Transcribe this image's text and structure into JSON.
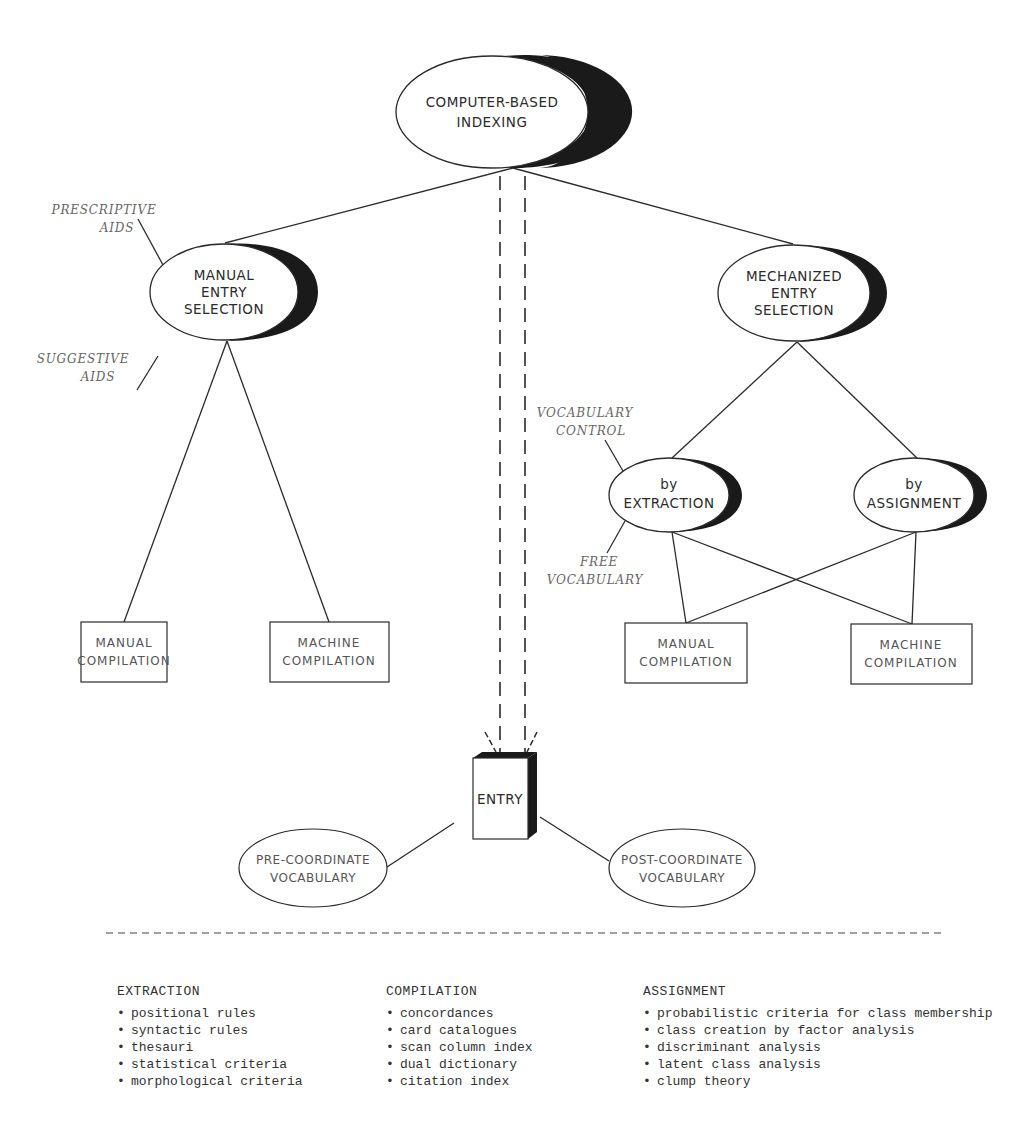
{
  "nodes": {
    "root": {
      "lines": [
        "COMPUTER-BASED",
        "INDEXING"
      ]
    },
    "manual_entry": {
      "lines": [
        "MANUAL",
        "ENTRY",
        "SELECTION"
      ]
    },
    "mechanized_entry": {
      "lines": [
        "MECHANIZED",
        "ENTRY",
        "SELECTION"
      ]
    },
    "by_extraction": {
      "lines": [
        "by",
        "EXTRACTION"
      ]
    },
    "by_assignment": {
      "lines": [
        "by",
        "ASSIGNMENT"
      ]
    },
    "entry": {
      "label": "ENTRY"
    },
    "pre_coordinate": {
      "lines": [
        "PRE-COORDINATE",
        "VOCABULARY"
      ]
    },
    "post_coordinate": {
      "lines": [
        "POST-COORDINATE",
        "VOCABULARY"
      ]
    }
  },
  "compilation_boxes": {
    "left_manual": {
      "lines": [
        "MANUAL",
        "COMPILATION"
      ]
    },
    "left_machine": {
      "lines": [
        "MACHINE",
        "COMPILATION"
      ]
    },
    "right_manual": {
      "lines": [
        "MANUAL",
        "COMPILATION"
      ]
    },
    "right_machine": {
      "lines": [
        "MACHINE",
        "COMPILATION"
      ]
    }
  },
  "annotations": {
    "prescriptive_aids": [
      "PRESCRIPTIVE",
      "AIDS"
    ],
    "suggestive_aids": [
      "SUGGESTIVE",
      "AIDS"
    ],
    "vocabulary_control": [
      "VOCABULARY",
      "CONTROL"
    ],
    "free_vocabulary": [
      "FREE",
      "VOCABULARY"
    ]
  },
  "legend": {
    "bullet": "•",
    "extraction": {
      "title": "EXTRACTION",
      "items": [
        "positional rules",
        "syntactic rules",
        "thesauri",
        "statistical criteria",
        "morphological criteria"
      ]
    },
    "compilation": {
      "title": "COMPILATION",
      "items": [
        "concordances",
        "card catalogues",
        "scan column index",
        "dual dictionary",
        "citation index"
      ]
    },
    "assignment": {
      "title": "ASSIGNMENT",
      "items": [
        "probabilistic criteria for class membership",
        "class creation by factor analysis",
        "discriminant analysis",
        "latent class analysis",
        "clump theory"
      ]
    }
  }
}
